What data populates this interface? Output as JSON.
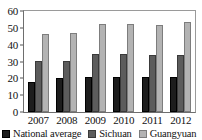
{
  "chart_data": {
    "type": "bar",
    "title": "",
    "subtitle": "",
    "xlabel": "",
    "ylabel": "",
    "categories": [
      "2007",
      "2008",
      "2009",
      "2010",
      "2011",
      "2012"
    ],
    "series": [
      {
        "name": "National average",
        "color": "#1d1d1d",
        "values": [
          18,
          20,
          21,
          20.8,
          20.8,
          20.6
        ]
      },
      {
        "name": "Sichuan",
        "color": "#5c5c5c",
        "values": [
          30.3,
          30.2,
          34.5,
          34.3,
          34,
          34
        ]
      },
      {
        "name": "Guangyuan",
        "color": "#b3b3b3",
        "values": [
          46.5,
          47.2,
          52,
          52,
          51.8,
          53.2
        ]
      }
    ],
    "ylim": [
      0,
      60
    ],
    "y_ticks": [
      0,
      10,
      20,
      30,
      40,
      50,
      60
    ],
    "y_tick_labels": [
      "0",
      "10",
      "20",
      "30",
      "40",
      "50",
      "60"
    ],
    "grid": false,
    "legend_position": "bottom"
  }
}
